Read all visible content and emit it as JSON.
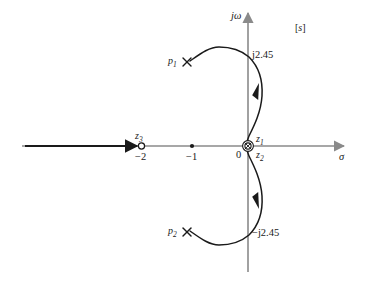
{
  "figure": {
    "title": "",
    "plane_label": "[s]",
    "axes": {
      "imaginary_label": "jω",
      "real_label": "σ",
      "origin_label": "0"
    }
  },
  "annotations": {
    "pole_1": "p",
    "pole_1_sub": "1",
    "pole_2": "p",
    "pole_2_sub": "2",
    "zero_1": "z",
    "zero_1_sub": "1",
    "zero_2": "z",
    "zero_2_sub": "2",
    "zero_3": "z",
    "zero_3_sub": "3",
    "cross_upper": "j2.45",
    "cross_lower": "−j2.45",
    "tick_minus_two": "−2",
    "tick_minus_one": "−1"
  },
  "chart_data": {
    "type": "scatter",
    "xlabel": "σ",
    "ylabel": "jω",
    "xlim": [
      -2.9,
      2.1
    ],
    "ylim": [
      -4.6,
      4.6
    ],
    "grid": false,
    "legend": "none",
    "poles": [
      {
        "name": "p1",
        "label": "p₁",
        "re": -1.5,
        "im": 1.5,
        "marker": "cross"
      },
      {
        "name": "p2",
        "label": "p₂",
        "re": -1.5,
        "im": -1.5,
        "marker": "cross"
      }
    ],
    "zeros": [
      {
        "name": "z1",
        "label": "z₁",
        "re": 0,
        "im": 0,
        "marker": "circle"
      },
      {
        "name": "z2",
        "label": "z₂",
        "re": 0,
        "im": 0,
        "marker": "circle"
      },
      {
        "name": "z3",
        "label": "z₃",
        "re": -2,
        "im": 0,
        "marker": "open-circle"
      }
    ],
    "axis_crossings": [
      {
        "label": "j2.45",
        "re": 0,
        "im": 2.45
      },
      {
        "label": "−j2.45",
        "re": 0,
        "im": -2.45
      }
    ],
    "real_axis_points": [
      {
        "label": "−2",
        "value": -2
      },
      {
        "label": "−1",
        "value": -1
      },
      {
        "label": "0",
        "value": 0
      }
    ],
    "branches": [
      {
        "name": "real-axis-branch",
        "from": "-infinity",
        "to": "z3 (-2)",
        "direction": "rightward"
      },
      {
        "name": "upper-branch",
        "from": "p1",
        "to": "z1 (origin)",
        "crosses_imag_axis_at": 2.45
      },
      {
        "name": "lower-branch",
        "from": "p2",
        "to": "z2 (origin)",
        "crosses_imag_axis_at": -2.45
      }
    ]
  }
}
